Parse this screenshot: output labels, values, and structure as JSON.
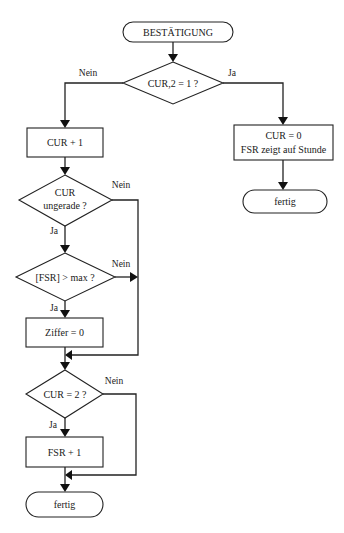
{
  "diagram": {
    "type": "flowchart",
    "title": "BESTÄTIGUNG",
    "nodes": {
      "start": {
        "shape": "terminal",
        "label": "BESTÄTIGUNG"
      },
      "d1": {
        "shape": "decision",
        "label": "CUR,2 = 1 ?"
      },
      "p_cur_plus": {
        "shape": "process",
        "label": "CUR + 1"
      },
      "d2": {
        "shape": "decision",
        "label_line1": "CUR",
        "label_line2": "ungerade ?"
      },
      "d3": {
        "shape": "decision",
        "label": "[FSR] > max ?"
      },
      "p_ziffer": {
        "shape": "process",
        "label": "Ziffer = 0"
      },
      "d4": {
        "shape": "decision",
        "label": "CUR = 2 ?"
      },
      "p_fsr_plus": {
        "shape": "process",
        "label": "FSR + 1"
      },
      "end_left": {
        "shape": "terminal",
        "label": "fertig"
      },
      "p_right": {
        "shape": "process",
        "label_line1": "CUR = 0",
        "label_line2": "FSR zeigt auf Stunde"
      },
      "end_right": {
        "shape": "terminal",
        "label": "fertig"
      }
    },
    "edge_labels": {
      "d1_no": "Nein",
      "d1_yes": "Ja",
      "d2_no": "Nein",
      "d2_yes": "Ja",
      "d3_no": "Nein",
      "d3_yes": "Ja",
      "d4_no": "Nein",
      "d4_yes": "Ja"
    },
    "edges": [
      {
        "from": "start",
        "to": "d1"
      },
      {
        "from": "d1",
        "to": "p_cur_plus",
        "label": "Nein"
      },
      {
        "from": "d1",
        "to": "p_right",
        "label": "Ja"
      },
      {
        "from": "p_right",
        "to": "end_right"
      },
      {
        "from": "p_cur_plus",
        "to": "d2"
      },
      {
        "from": "d2",
        "to": "d3",
        "label": "Ja"
      },
      {
        "from": "d2",
        "to": "merge1",
        "label": "Nein"
      },
      {
        "from": "d3",
        "to": "p_ziffer",
        "label": "Ja"
      },
      {
        "from": "d3",
        "to": "merge1",
        "label": "Nein"
      },
      {
        "from": "p_ziffer",
        "to": "d4"
      },
      {
        "from": "d4",
        "to": "p_fsr_plus",
        "label": "Ja"
      },
      {
        "from": "d4",
        "to": "merge2",
        "label": "Nein"
      },
      {
        "from": "p_fsr_plus",
        "to": "end_left"
      }
    ]
  }
}
